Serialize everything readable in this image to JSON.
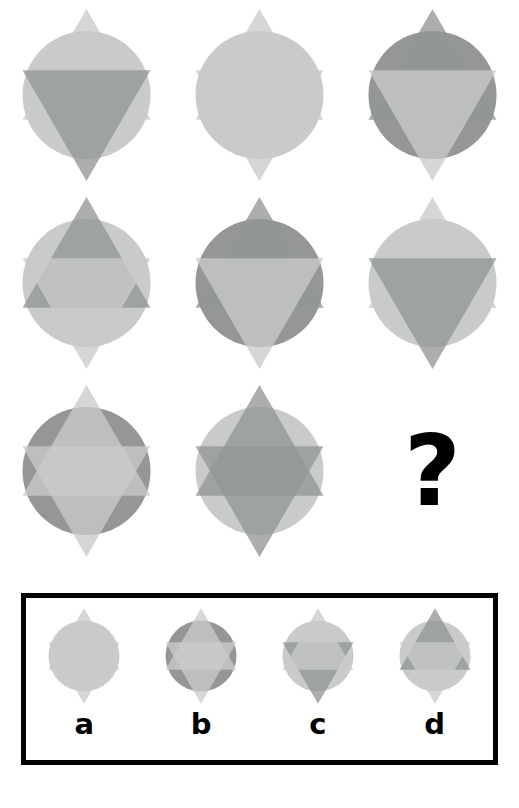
{
  "puzzle": {
    "type": "visual-analogy-matrix",
    "title_text": "",
    "question_mark": "?",
    "rows": 3,
    "cols": 3,
    "palette": {
      "light": "#c9cbc9",
      "dark": "#949794",
      "background": "#ffffff",
      "border": "#000000",
      "label": "#000000"
    },
    "layer_order": [
      "circle",
      "up-triangle",
      "down-triangle"
    ],
    "matrix": [
      [
        {
          "id": "r1c1",
          "circle": "light",
          "up": "light",
          "down": "dark",
          "down_on_top": true
        },
        {
          "id": "r1c2",
          "circle": "light",
          "up": "light",
          "down": "light",
          "down_on_top": true
        },
        {
          "id": "r1c3",
          "circle": "dark",
          "up": "dark",
          "down": "light",
          "down_on_top": true
        }
      ],
      [
        {
          "id": "r2c1",
          "circle": "light",
          "up": "dark",
          "down": "light",
          "down_on_top": true
        },
        {
          "id": "r2c2",
          "circle": "dark",
          "up": "dark",
          "down": "light",
          "down_on_top": true
        },
        {
          "id": "r2c3",
          "circle": "light",
          "up": "light",
          "down": "dark",
          "down_on_top": true
        }
      ],
      [
        {
          "id": "r3c1",
          "circle": "dark",
          "up": "light",
          "down": "light",
          "down_on_top": true
        },
        {
          "id": "r3c2",
          "circle": "light",
          "up": "dark",
          "down": "dark",
          "down_on_top": true
        },
        {
          "id": "r3c3",
          "circle": "none",
          "up": "none",
          "down": "none",
          "down_on_top": true
        }
      ]
    ],
    "options": [
      {
        "label": "a",
        "id": "option-a",
        "circle": "light",
        "up": "light",
        "down": "light",
        "down_on_top": true
      },
      {
        "label": "b",
        "id": "option-b",
        "circle": "dark",
        "up": "light",
        "down": "light",
        "down_on_top": true
      },
      {
        "label": "c",
        "id": "option-c",
        "circle": "light",
        "up": "light",
        "down": "dark",
        "down_on_top": false
      },
      {
        "label": "d",
        "id": "option-d",
        "circle": "light",
        "up": "dark",
        "down": "light",
        "down_on_top": true
      }
    ]
  }
}
